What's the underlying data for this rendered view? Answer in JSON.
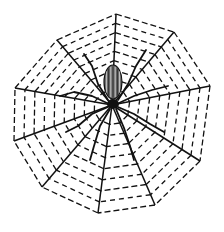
{
  "illustration": {
    "subject": "Spider on a dashed orb web",
    "style": "black-and-white line engraving",
    "colors": {
      "ink": "#111111",
      "background": "#ffffff",
      "abdomen_fill": "#6a6a6a"
    },
    "web": {
      "center": [
        112,
        105
      ],
      "spokes": [
        [
          116,
          14
        ],
        [
          174,
          32
        ],
        [
          210,
          86
        ],
        [
          200,
          161
        ],
        [
          155,
          205
        ],
        [
          98,
          213
        ],
        [
          42,
          187
        ],
        [
          14,
          141
        ],
        [
          15,
          88
        ],
        [
          57,
          40
        ]
      ],
      "rings": 9
    },
    "spider": {
      "abdomen": {
        "cx": 113,
        "cy": 82,
        "rx": 9,
        "ry": 17
      },
      "cephalothorax": {
        "cx": 113,
        "cy": 104,
        "rx": 6,
        "ry": 5
      }
    }
  }
}
